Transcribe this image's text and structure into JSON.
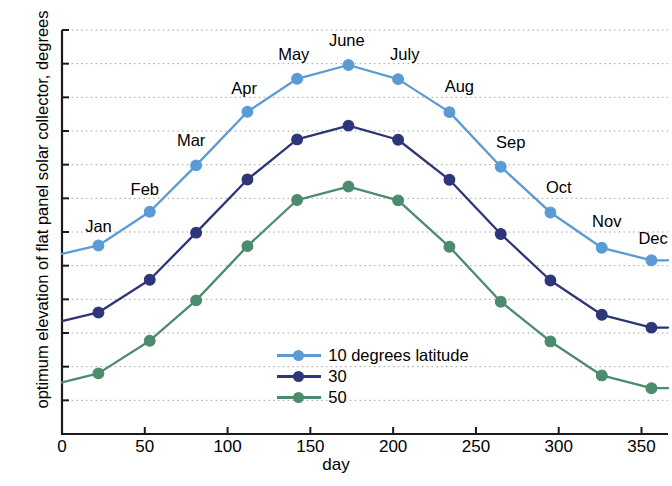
{
  "chart_data": {
    "type": "line",
    "title": "",
    "xlabel": "day",
    "ylabel": "optimum elevation of flat panel solar collector, degrees",
    "xlim": [
      0,
      366
    ],
    "ylim": [
      0,
      120
    ],
    "xticks": [
      "0",
      "50",
      "100",
      "150",
      "200",
      "250",
      "300",
      "350"
    ],
    "xtick_values": [
      0,
      50,
      100,
      150,
      200,
      250,
      300,
      350
    ],
    "yticks": [
      "0",
      "10",
      "20",
      "30",
      "40",
      "50",
      "60",
      "70",
      "80",
      "90",
      "100",
      "110",
      "120"
    ],
    "ytick_values": [
      0,
      10,
      20,
      30,
      40,
      50,
      60,
      70,
      80,
      90,
      100,
      110,
      120
    ],
    "grid": "horizontal dotted",
    "legend_position": "inside lower center-right",
    "x": [
      0,
      22,
      53,
      81,
      112,
      142,
      173,
      203,
      234,
      265,
      295,
      326,
      356,
      366
    ],
    "series": [
      {
        "name": "10 degrees latitude",
        "color": "#5B9BD5",
        "marker": "circle",
        "values": [
          53.5,
          56.0,
          66.0,
          79.8,
          95.7,
          105.5,
          109.6,
          105.4,
          95.6,
          79.4,
          65.8,
          55.3,
          51.6,
          51.6
        ]
      },
      {
        "name": "30",
        "color": "#2E3578",
        "marker": "circle",
        "values": [
          33.5,
          36.1,
          45.8,
          59.8,
          75.6,
          87.5,
          91.6,
          87.4,
          75.5,
          59.4,
          45.6,
          35.4,
          31.6,
          31.6
        ]
      },
      {
        "name": "50",
        "color": "#4D8B6F",
        "marker": "circle",
        "values": [
          15.3,
          18.0,
          27.7,
          39.7,
          55.8,
          69.5,
          73.5,
          69.4,
          55.6,
          39.3,
          27.5,
          17.4,
          13.6,
          13.6
        ]
      }
    ],
    "annotations": [
      {
        "label": "Jan",
        "x": 22,
        "y": 60.0
      },
      {
        "label": "Feb",
        "x": 50,
        "y": 71.0
      },
      {
        "label": "Mar",
        "x": 78,
        "y": 85.5
      },
      {
        "label": "Apr",
        "x": 110,
        "y": 101.0
      },
      {
        "label": "May",
        "x": 140,
        "y": 111.2
      },
      {
        "label": "June",
        "x": 172,
        "y": 115.2
      },
      {
        "label": "July",
        "x": 207,
        "y": 111.0
      },
      {
        "label": "Aug",
        "x": 240,
        "y": 101.5
      },
      {
        "label": "Sep",
        "x": 271,
        "y": 85.0
      },
      {
        "label": "Oct",
        "x": 300,
        "y": 71.5
      },
      {
        "label": "Nov",
        "x": 329,
        "y": 61.5
      },
      {
        "label": "Dec",
        "x": 357,
        "y": 56.5
      }
    ]
  },
  "legend": {
    "entries": [
      {
        "label": "10 degrees latitude",
        "color": "#5B9BD5"
      },
      {
        "label": "30",
        "color": "#2E3578"
      },
      {
        "label": "50",
        "color": "#4D8B6F"
      }
    ]
  }
}
